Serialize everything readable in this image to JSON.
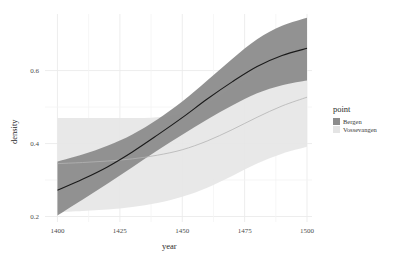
{
  "chart_data": {
    "type": "line",
    "title": "",
    "xlabel": "year",
    "ylabel": "density",
    "xlim": [
      1395,
      1502
    ],
    "ylim": [
      0.185,
      0.755
    ],
    "grid": true,
    "xticks": [
      1400,
      1425,
      1450,
      1475,
      1500
    ],
    "xtick_labels": [
      "1400",
      "1425",
      "1450",
      "1475",
      "1500"
    ],
    "yticks": [
      0.2,
      0.4,
      0.6
    ],
    "ytick_labels": [
      "0.2",
      "0.4",
      "0.6"
    ],
    "legend": {
      "title": "point",
      "position": "right",
      "entries": [
        {
          "label": "Bergen",
          "color": "#8c8c8c"
        },
        {
          "label": "Vossevangen",
          "color": "#e4e4e4"
        }
      ]
    },
    "x": [
      1400,
      1410,
      1420,
      1430,
      1440,
      1450,
      1460,
      1470,
      1480,
      1490,
      1500
    ],
    "series": [
      {
        "name": "Bergen",
        "line_color": "#1a1a1a",
        "ribbon_color": "#8c8c8c",
        "values": [
          0.272,
          0.302,
          0.336,
          0.377,
          0.423,
          0.471,
          0.522,
          0.569,
          0.611,
          0.641,
          0.661
        ],
        "ribbon_lower": [
          0.203,
          0.246,
          0.29,
          0.335,
          0.381,
          0.424,
          0.466,
          0.504,
          0.538,
          0.56,
          0.573
        ],
        "ribbon_upper": [
          0.351,
          0.37,
          0.394,
          0.425,
          0.466,
          0.515,
          0.573,
          0.632,
          0.686,
          0.723,
          0.745
        ]
      },
      {
        "name": "Vossevangen",
        "line_color": "#b4b4b4",
        "ribbon_color": "#e6e6e6",
        "values": [
          0.345,
          0.348,
          0.352,
          0.358,
          0.368,
          0.383,
          0.407,
          0.438,
          0.472,
          0.503,
          0.527
        ],
        "ribbon_lower": [
          0.212,
          0.215,
          0.219,
          0.226,
          0.237,
          0.254,
          0.279,
          0.311,
          0.345,
          0.372,
          0.391
        ],
        "ribbon_upper": [
          0.47,
          0.47,
          0.47,
          0.47,
          0.472,
          0.484,
          0.512,
          0.555,
          0.602,
          0.643,
          0.67
        ]
      }
    ]
  }
}
